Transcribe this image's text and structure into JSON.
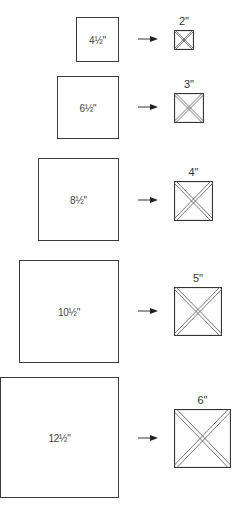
{
  "diagram": {
    "rows": [
      {
        "cut_label": "4½\"",
        "finished_label": "2\""
      },
      {
        "cut_label": "6½\"",
        "finished_label": "3\""
      },
      {
        "cut_label": "8½\"",
        "finished_label": "4\""
      },
      {
        "cut_label": "10½\"",
        "finished_label": "5\""
      },
      {
        "cut_label": "12½\"",
        "finished_label": "6\""
      }
    ],
    "colors": {
      "line": "#3a3a3a",
      "text": "#333333",
      "background": "#ffffff"
    }
  }
}
